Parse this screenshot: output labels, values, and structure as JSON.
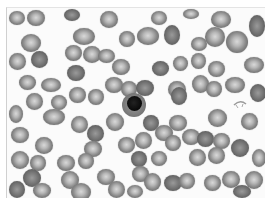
{
  "image": {
    "description": "Grayscale light micrograph of a peripheral blood smear showing numerous red blood cells and a single nucleated cell with a dark round nucleus near the center",
    "palette": {
      "background": "#fbfbfb",
      "cell_rim": "#6a6a6a",
      "cell_center": "#d9d9d9",
      "nucleus": "#080808"
    },
    "cells": [
      {
        "x": 8,
        "y": 10,
        "w": 16,
        "h": 14
      },
      {
        "x": 26,
        "y": 9,
        "w": 18,
        "h": 16
      },
      {
        "x": 63,
        "y": 8,
        "w": 16,
        "h": 12
      },
      {
        "x": 99,
        "y": 10,
        "w": 18,
        "h": 17
      },
      {
        "x": 150,
        "y": 10,
        "w": 16,
        "h": 14
      },
      {
        "x": 182,
        "y": 8,
        "w": 16,
        "h": 10
      },
      {
        "x": 210,
        "y": 10,
        "w": 20,
        "h": 17
      },
      {
        "x": 248,
        "y": 14,
        "w": 16,
        "h": 22
      },
      {
        "x": 20,
        "y": 33,
        "w": 20,
        "h": 18
      },
      {
        "x": 72,
        "y": 27,
        "w": 22,
        "h": 17
      },
      {
        "x": 118,
        "y": 30,
        "w": 16,
        "h": 16
      },
      {
        "x": 136,
        "y": 26,
        "w": 22,
        "h": 18
      },
      {
        "x": 163,
        "y": 24,
        "w": 16,
        "h": 20
      },
      {
        "x": 190,
        "y": 36,
        "w": 16,
        "h": 14
      },
      {
        "x": 204,
        "y": 26,
        "w": 20,
        "h": 20
      },
      {
        "x": 225,
        "y": 30,
        "w": 22,
        "h": 22
      },
      {
        "x": 8,
        "y": 52,
        "w": 17,
        "h": 17
      },
      {
        "x": 30,
        "y": 50,
        "w": 17,
        "h": 17
      },
      {
        "x": 64,
        "y": 44,
        "w": 17,
        "h": 16
      },
      {
        "x": 82,
        "y": 45,
        "w": 18,
        "h": 17
      },
      {
        "x": 97,
        "y": 48,
        "w": 17,
        "h": 14
      },
      {
        "x": 111,
        "y": 58,
        "w": 18,
        "h": 16
      },
      {
        "x": 151,
        "y": 60,
        "w": 17,
        "h": 15
      },
      {
        "x": 172,
        "y": 55,
        "w": 15,
        "h": 15
      },
      {
        "x": 190,
        "y": 52,
        "w": 15,
        "h": 16
      },
      {
        "x": 207,
        "y": 60,
        "w": 17,
        "h": 16
      },
      {
        "x": 243,
        "y": 56,
        "w": 20,
        "h": 16
      },
      {
        "x": 66,
        "y": 64,
        "w": 18,
        "h": 16
      },
      {
        "x": 18,
        "y": 74,
        "w": 17,
        "h": 15
      },
      {
        "x": 40,
        "y": 77,
        "w": 20,
        "h": 14
      },
      {
        "x": 104,
        "y": 76,
        "w": 18,
        "h": 16
      },
      {
        "x": 120,
        "y": 80,
        "w": 16,
        "h": 16
      },
      {
        "x": 135,
        "y": 79,
        "w": 18,
        "h": 16
      },
      {
        "x": 167,
        "y": 80,
        "w": 18,
        "h": 17
      },
      {
        "x": 191,
        "y": 74,
        "w": 17,
        "h": 18
      },
      {
        "x": 205,
        "y": 80,
        "w": 16,
        "h": 16
      },
      {
        "x": 224,
        "y": 76,
        "w": 20,
        "h": 16
      },
      {
        "x": 249,
        "y": 83,
        "w": 16,
        "h": 18
      },
      {
        "x": 25,
        "y": 92,
        "w": 17,
        "h": 17
      },
      {
        "x": 50,
        "y": 94,
        "w": 16,
        "h": 15
      },
      {
        "x": 68,
        "y": 86,
        "w": 17,
        "h": 16
      },
      {
        "x": 87,
        "y": 88,
        "w": 16,
        "h": 16
      },
      {
        "x": 170,
        "y": 86,
        "w": 16,
        "h": 18
      },
      {
        "x": 8,
        "y": 104,
        "w": 14,
        "h": 18
      },
      {
        "x": 42,
        "y": 108,
        "w": 22,
        "h": 16
      },
      {
        "x": 70,
        "y": 115,
        "w": 17,
        "h": 17
      },
      {
        "x": 105,
        "y": 112,
        "w": 18,
        "h": 18
      },
      {
        "x": 142,
        "y": 114,
        "w": 16,
        "h": 16
      },
      {
        "x": 168,
        "y": 114,
        "w": 18,
        "h": 16
      },
      {
        "x": 207,
        "y": 108,
        "w": 19,
        "h": 18
      },
      {
        "x": 240,
        "y": 112,
        "w": 17,
        "h": 17
      },
      {
        "x": 10,
        "y": 126,
        "w": 18,
        "h": 16
      },
      {
        "x": 86,
        "y": 124,
        "w": 17,
        "h": 17
      },
      {
        "x": 117,
        "y": 136,
        "w": 17,
        "h": 16
      },
      {
        "x": 134,
        "y": 131,
        "w": 17,
        "h": 17
      },
      {
        "x": 154,
        "y": 124,
        "w": 18,
        "h": 16
      },
      {
        "x": 181,
        "y": 128,
        "w": 18,
        "h": 16
      },
      {
        "x": 196,
        "y": 130,
        "w": 17,
        "h": 16
      },
      {
        "x": 212,
        "y": 132,
        "w": 17,
        "h": 16
      },
      {
        "x": 34,
        "y": 136,
        "w": 18,
        "h": 17
      },
      {
        "x": 83,
        "y": 140,
        "w": 18,
        "h": 16
      },
      {
        "x": 164,
        "y": 134,
        "w": 16,
        "h": 16
      },
      {
        "x": 230,
        "y": 138,
        "w": 18,
        "h": 18
      },
      {
        "x": 10,
        "y": 150,
        "w": 18,
        "h": 18
      },
      {
        "x": 29,
        "y": 154,
        "w": 16,
        "h": 16
      },
      {
        "x": 56,
        "y": 154,
        "w": 18,
        "h": 16
      },
      {
        "x": 77,
        "y": 152,
        "w": 16,
        "h": 16
      },
      {
        "x": 130,
        "y": 150,
        "w": 16,
        "h": 16
      },
      {
        "x": 150,
        "y": 150,
        "w": 16,
        "h": 15
      },
      {
        "x": 188,
        "y": 148,
        "w": 17,
        "h": 17
      },
      {
        "x": 207,
        "y": 146,
        "w": 17,
        "h": 17
      },
      {
        "x": 251,
        "y": 148,
        "w": 14,
        "h": 18
      },
      {
        "x": 22,
        "y": 168,
        "w": 18,
        "h": 18
      },
      {
        "x": 60,
        "y": 170,
        "w": 18,
        "h": 18
      },
      {
        "x": 96,
        "y": 168,
        "w": 18,
        "h": 16
      },
      {
        "x": 131,
        "y": 165,
        "w": 17,
        "h": 16
      },
      {
        "x": 143,
        "y": 172,
        "w": 17,
        "h": 18
      },
      {
        "x": 163,
        "y": 174,
        "w": 18,
        "h": 16
      },
      {
        "x": 178,
        "y": 172,
        "w": 16,
        "h": 16
      },
      {
        "x": 203,
        "y": 174,
        "w": 17,
        "h": 16
      },
      {
        "x": 221,
        "y": 170,
        "w": 18,
        "h": 17
      },
      {
        "x": 244,
        "y": 170,
        "w": 18,
        "h": 18
      },
      {
        "x": 8,
        "y": 180,
        "w": 16,
        "h": 17
      },
      {
        "x": 32,
        "y": 182,
        "w": 18,
        "h": 15
      },
      {
        "x": 107,
        "y": 180,
        "w": 17,
        "h": 17
      },
      {
        "x": 126,
        "y": 184,
        "w": 16,
        "h": 13
      },
      {
        "x": 70,
        "y": 182,
        "w": 20,
        "h": 18
      },
      {
        "x": 232,
        "y": 184,
        "w": 18,
        "h": 13
      }
    ],
    "nucleated_cell": {
      "x": 121,
      "y": 92,
      "w": 24,
      "h": 24,
      "nucleus": {
        "x": 126,
        "y": 95,
        "w": 15,
        "h": 15
      }
    },
    "artifact": {
      "x": 232,
      "y": 98,
      "label": "small curved fragment"
    }
  }
}
